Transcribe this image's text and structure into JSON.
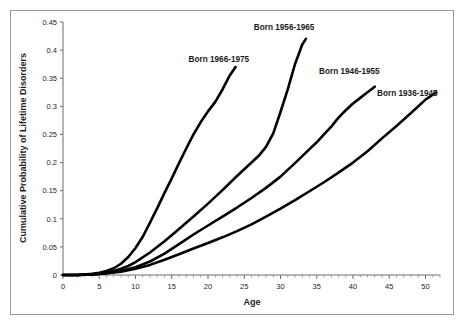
{
  "chart_data": {
    "type": "line",
    "title": "",
    "xlabel": "Age",
    "ylabel": "Cumulative Probability of Lifetime Disorders",
    "xlim": [
      0,
      52
    ],
    "ylim": [
      0,
      0.45
    ],
    "grid": false,
    "legend_position": "inline-annotations",
    "x_ticks": [
      0,
      5,
      10,
      15,
      20,
      25,
      30,
      35,
      40,
      45,
      50
    ],
    "x_tick_labels": [
      "0",
      "5",
      "10",
      "15",
      "20",
      "25",
      "30",
      "35",
      "40",
      "45",
      "50"
    ],
    "x_minor_tick_step": 1,
    "y_ticks": [
      0,
      0.05,
      0.1,
      0.15,
      0.2,
      0.25,
      0.3,
      0.35,
      0.4,
      0.45
    ],
    "y_tick_labels": [
      "0",
      "0.05",
      "0.1",
      "0.15",
      "0.2",
      "0.25",
      "0.3",
      "0.35",
      "0.4",
      "0.45"
    ],
    "line_color": "#000000",
    "series": [
      {
        "name": "Born 1966-1975",
        "label": "Born 1966-1975",
        "label_x": 21.5,
        "label_y": 0.378,
        "x": [
          0,
          2,
          4,
          5,
          6,
          7,
          8,
          9,
          10,
          11,
          12,
          13,
          14,
          15,
          16,
          17,
          18,
          19,
          20,
          21,
          22,
          23,
          23.8
        ],
        "y": [
          0,
          0.0,
          0.002,
          0.004,
          0.007,
          0.012,
          0.02,
          0.032,
          0.048,
          0.068,
          0.093,
          0.119,
          0.146,
          0.172,
          0.199,
          0.225,
          0.25,
          0.272,
          0.291,
          0.308,
          0.33,
          0.355,
          0.37
        ]
      },
      {
        "name": "Born 1956-1965",
        "label": "Born 1956-1965",
        "label_x": 30.5,
        "label_y": 0.435,
        "x": [
          0,
          2,
          4,
          5,
          6,
          7,
          8,
          9,
          10,
          12,
          14,
          16,
          18,
          20,
          22,
          24,
          26,
          27,
          28,
          29,
          30,
          31,
          32,
          33,
          33.5
        ],
        "y": [
          0,
          0.0,
          0.001,
          0.002,
          0.004,
          0.007,
          0.011,
          0.016,
          0.023,
          0.04,
          0.06,
          0.082,
          0.104,
          0.127,
          0.151,
          0.176,
          0.2,
          0.212,
          0.228,
          0.252,
          0.29,
          0.33,
          0.375,
          0.41,
          0.42
        ]
      },
      {
        "name": "Born 1946-1955",
        "label": "Born 1946-1955",
        "label_x": 39.5,
        "label_y": 0.358,
        "x": [
          0,
          2,
          4,
          6,
          8,
          10,
          12,
          14,
          16,
          18,
          20,
          22,
          24,
          26,
          28,
          30,
          32,
          34,
          35,
          36,
          37,
          38,
          39,
          40,
          41,
          42,
          43
        ],
        "y": [
          0,
          0.0,
          0.001,
          0.003,
          0.007,
          0.014,
          0.024,
          0.038,
          0.055,
          0.072,
          0.088,
          0.104,
          0.12,
          0.137,
          0.155,
          0.175,
          0.199,
          0.224,
          0.236,
          0.25,
          0.264,
          0.28,
          0.293,
          0.305,
          0.315,
          0.325,
          0.335
        ]
      },
      {
        "name": "Born 1936-1945",
        "label": "Born 1936-1945",
        "label_x": 47.5,
        "label_y": 0.318,
        "x": [
          0,
          2,
          4,
          6,
          8,
          10,
          12,
          14,
          16,
          18,
          20,
          22,
          24,
          26,
          28,
          30,
          32,
          34,
          36,
          38,
          40,
          42,
          44,
          46,
          48,
          50,
          51.5
        ],
        "y": [
          0,
          0.0,
          0.001,
          0.003,
          0.006,
          0.011,
          0.018,
          0.027,
          0.037,
          0.047,
          0.057,
          0.067,
          0.078,
          0.09,
          0.104,
          0.118,
          0.133,
          0.149,
          0.165,
          0.182,
          0.2,
          0.22,
          0.243,
          0.265,
          0.288,
          0.312,
          0.325
        ]
      }
    ]
  }
}
